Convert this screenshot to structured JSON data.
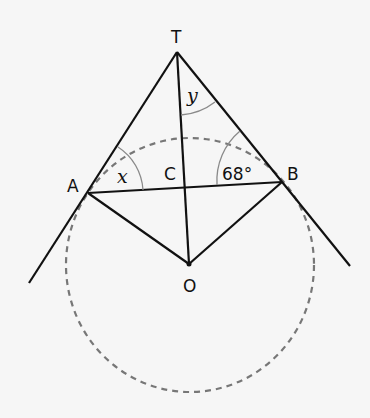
{
  "diagram": {
    "points": {
      "T": {
        "label": "T",
        "x": 177,
        "y": 52
      },
      "A": {
        "label": "A",
        "x": 88,
        "y": 193
      },
      "B": {
        "label": "B",
        "x": 282,
        "y": 182
      },
      "C": {
        "label": "C",
        "x": 184,
        "y": 188
      },
      "O": {
        "label": "O",
        "x": 189,
        "y": 264
      }
    },
    "angles": {
      "x": {
        "label": "x",
        "at": "A",
        "between": [
          "AT",
          "AB"
        ]
      },
      "y": {
        "label": "y",
        "at": "T",
        "between": [
          "TO",
          "TB"
        ]
      },
      "b": {
        "label": "68°",
        "at": "B",
        "between": [
          "BA",
          "BT"
        ],
        "value_deg": 68
      }
    },
    "circle": {
      "center": "O",
      "style": "dashed",
      "color": "#777777"
    },
    "colors": {
      "background": "#f6f6f6",
      "line": "#111111",
      "arc": "#8a8a8a",
      "circle": "#777777"
    }
  }
}
